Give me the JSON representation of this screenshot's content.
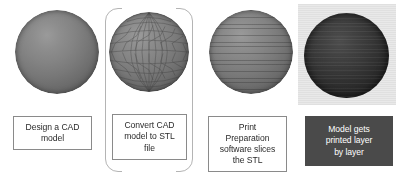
{
  "figure": {
    "background_color": "#ffffff",
    "caption_border_color": "#8a8a8a",
    "caption_fill_color": "#4a4a4a",
    "caption_fill_text_color": "#ffffff",
    "bracket_color": "#b4b4b4"
  },
  "steps": [
    {
      "id": "step-1",
      "visual": "sphere-smooth",
      "visual_name": "cad-sphere",
      "caption_style": "outlined",
      "caption_lines": [
        "Design a CAD",
        "model"
      ]
    },
    {
      "id": "step-2",
      "visual": "sphere-mesh",
      "visual_name": "stl-mesh-sphere",
      "caption_style": "outlined",
      "bracketed": true,
      "caption_lines": [
        "Convert CAD",
        "model to STL",
        "file"
      ]
    },
    {
      "id": "step-3",
      "visual": "sphere-sliced",
      "visual_name": "sliced-sphere",
      "caption_style": "outlined",
      "caption_lines": [
        "Print",
        "Preparation",
        "software slices",
        "the STL"
      ]
    },
    {
      "id": "step-4",
      "visual": "photo-sphere",
      "visual_name": "printed-model-photo",
      "caption_style": "filled",
      "caption_lines": [
        "Model gets",
        "printed layer",
        "by layer"
      ]
    }
  ]
}
